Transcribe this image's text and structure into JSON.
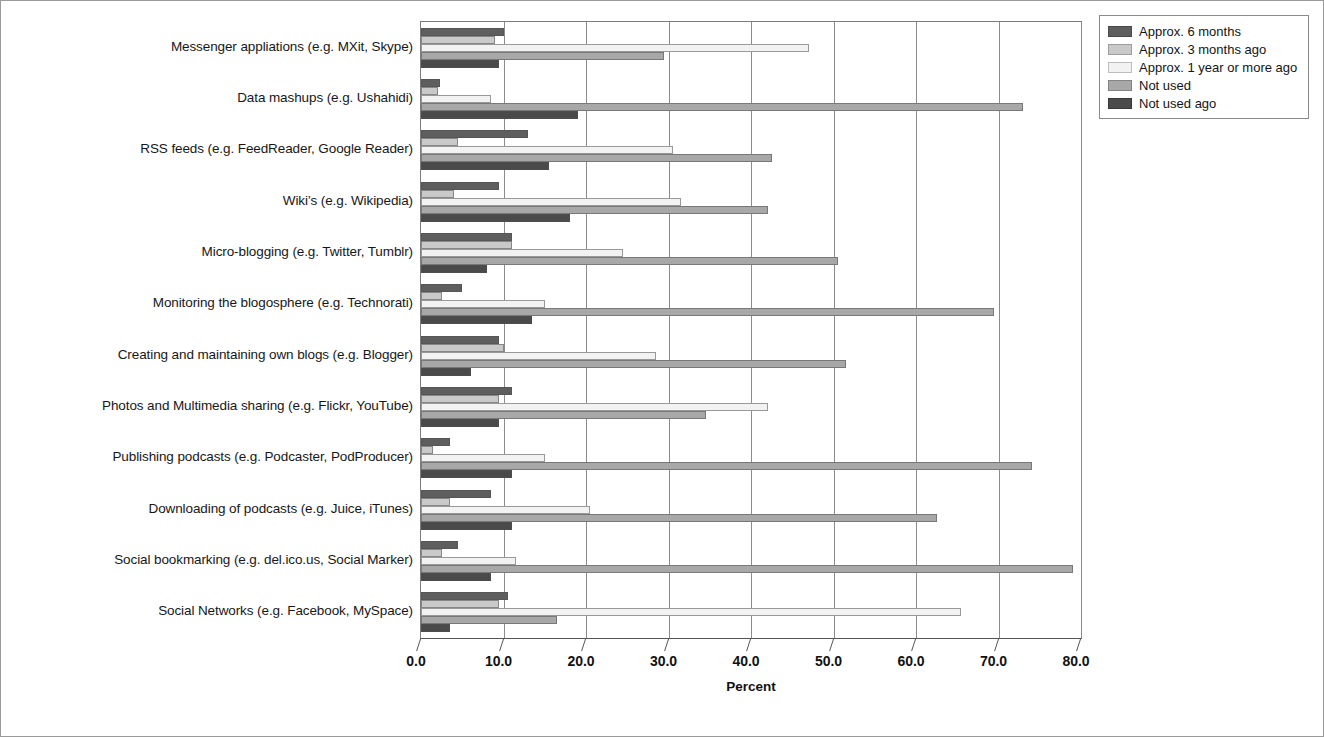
{
  "chart_data": {
    "type": "bar",
    "orientation": "horizontal",
    "title": "",
    "xlabel": "Percent",
    "ylabel": "",
    "xlim": [
      0.0,
      80.0
    ],
    "xticks": [
      "0.0",
      "10.0",
      "20.0",
      "30.0",
      "40.0",
      "50.0",
      "60.0",
      "70.0",
      "80.0"
    ],
    "grid": "vertical",
    "legend_position": "top-right",
    "categories": [
      "Messenger appliations (e.g. MXit, Skype)",
      "Data mashups (e.g. Ushahidi)",
      "RSS feeds (e.g. FeedReader, Google Reader)",
      "Wiki’s (e.g. Wikipedia)",
      "Micro-blogging (e.g. Twitter, Tumblr)",
      "Monitoring the blogosphere (e.g. Technorati)",
      "Creating and maintaining own blogs (e.g. Blogger)",
      "Photos and Multimedia sharing (e.g. Flickr, YouTube)",
      "Publishing podcasts (e.g. Podcaster, PodProducer)",
      "Downloading of podcasts (e.g. Juice, iTunes)",
      "Social bookmarking (e.g. del.ico.us, Social Marker)",
      "Social Networks (e.g. Facebook, MySpace)"
    ],
    "series": [
      {
        "name": "Approx. 6 months",
        "color": "#5e5e5e",
        "values": [
          10.0,
          2.3,
          13.0,
          9.5,
          11.0,
          5.0,
          9.5,
          11.0,
          3.5,
          8.5,
          4.5,
          10.5
        ]
      },
      {
        "name": "Approx. 3 months ago",
        "color": "#c9c9c9",
        "values": [
          9.0,
          2.0,
          4.5,
          4.0,
          11.0,
          2.5,
          10.0,
          9.5,
          1.5,
          3.5,
          2.5,
          9.5
        ]
      },
      {
        "name": "Approx. 1 year or more ago",
        "color": "#f2f2f2",
        "values": [
          47.0,
          8.5,
          30.5,
          31.5,
          24.5,
          15.0,
          28.5,
          42.0,
          15.0,
          20.5,
          11.5,
          65.5
        ]
      },
      {
        "name": "Not used",
        "color": "#a8a8a8",
        "values": [
          29.5,
          73.0,
          42.5,
          42.0,
          50.5,
          69.5,
          51.5,
          34.5,
          74.0,
          62.5,
          79.0,
          16.5
        ]
      },
      {
        "name": "Not used ago",
        "color": "#4a4a4a",
        "values": [
          9.5,
          19.0,
          15.5,
          18.0,
          8.0,
          13.5,
          6.0,
          9.5,
          11.0,
          11.0,
          8.5,
          3.5
        ]
      }
    ]
  }
}
